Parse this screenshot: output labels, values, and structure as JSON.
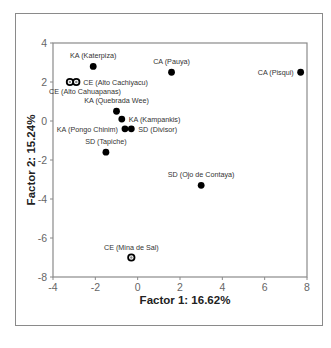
{
  "chart_data": {
    "type": "scatter",
    "title": "",
    "xlabel": "Factor 1: 16.62%",
    "ylabel": "Factor 2: 15.24%",
    "xlim": [
      -4,
      8
    ],
    "ylim": [
      -8,
      4
    ],
    "xticks": [
      -4,
      -2,
      0,
      2,
      4,
      6,
      8
    ],
    "yticks": [
      -8,
      -6,
      -4,
      -2,
      0,
      2,
      4
    ],
    "grid": false,
    "legend": null,
    "points": [
      {
        "label": "KA (Katerpiza)",
        "x": -2.1,
        "y": 2.8,
        "marker": "filled",
        "label_pos": "above"
      },
      {
        "label": "CE (Alto Cachiyacu)",
        "x": -2.9,
        "y": 2.0,
        "marker": "ring",
        "label_pos": "right"
      },
      {
        "label": "CE (Alto Cahuapanas)",
        "x": -3.2,
        "y": 2.0,
        "marker": "ring",
        "label_pos": "below"
      },
      {
        "label": "CA (Pauya)",
        "x": 1.6,
        "y": 2.5,
        "marker": "filled",
        "label_pos": "above"
      },
      {
        "label": "CA (Pisqui)",
        "x": 7.7,
        "y": 2.5,
        "marker": "filled",
        "label_pos": "left"
      },
      {
        "label": "KA (Quebrada Wee)",
        "x": -1.0,
        "y": 0.5,
        "marker": "filled",
        "label_pos": "above"
      },
      {
        "label": "KA (Kampankis)",
        "x": -0.75,
        "y": 0.1,
        "marker": "filled",
        "label_pos": "right"
      },
      {
        "label": "KA (Pongo Chinim)",
        "x": -0.6,
        "y": -0.4,
        "marker": "filled",
        "label_pos": "left"
      },
      {
        "label": "SD (Divisor)",
        "x": -0.3,
        "y": -0.4,
        "marker": "filled",
        "label_pos": "right"
      },
      {
        "label": "SD (Tapiche)",
        "x": -1.5,
        "y": -1.6,
        "marker": "filled",
        "label_pos": "above"
      },
      {
        "label": "SD (Ojo de Contaya)",
        "x": 3.0,
        "y": -3.3,
        "marker": "filled",
        "label_pos": "above"
      },
      {
        "label": "CE (Mina de Sal)",
        "x": -0.3,
        "y": -7.0,
        "marker": "ring",
        "label_pos": "above"
      }
    ]
  },
  "colors": {
    "marker": "#000000",
    "axis": "#8a8a8a",
    "tick_text": "#666666",
    "label_text": "#333333",
    "frame": "#8a8a8a"
  }
}
